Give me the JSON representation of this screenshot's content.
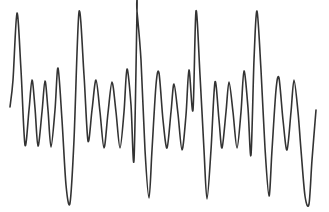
{
  "figure": {
    "name": "waveform-trace",
    "kind": "oscillogram",
    "background_color": "#ffffff",
    "width": 329,
    "height": 212
  },
  "chart_data": {
    "type": "line",
    "title": "",
    "subtitle": "",
    "xlabel": "",
    "ylabel": "",
    "xlim": [
      0,
      329
    ],
    "ylim": [
      212,
      0
    ],
    "grid": false,
    "legend": null,
    "axes_visible": false,
    "tick_labels": {
      "x": [],
      "y": []
    },
    "annotations": [],
    "series": [
      {
        "name": "signal",
        "color": "#333333",
        "line_width": 1.6,
        "smoothing": "cardinal-spline",
        "description": "Five-cycle quasi-periodic oscillation; each cycle contains one tall narrow positive spike, one deep negative spike, and three to four lower-amplitude ripples.",
        "points": [
          [
            10,
            107
          ],
          [
            13,
            80
          ],
          [
            17,
            13
          ],
          [
            21,
            70
          ],
          [
            25,
            145
          ],
          [
            29,
            110
          ],
          [
            32,
            80
          ],
          [
            35,
            108
          ],
          [
            38,
            146
          ],
          [
            42,
            112
          ],
          [
            45,
            81
          ],
          [
            48,
            110
          ],
          [
            51,
            147
          ],
          [
            55,
            110
          ],
          [
            58,
            68
          ],
          [
            62,
            120
          ],
          [
            66,
            185
          ],
          [
            70,
            203
          ],
          [
            74,
            140
          ],
          [
            79,
            12
          ],
          [
            84,
            75
          ],
          [
            88,
            141
          ],
          [
            92,
            110
          ],
          [
            96,
            80
          ],
          [
            100,
            112
          ],
          [
            104,
            148
          ],
          [
            108,
            113
          ],
          [
            112,
            82
          ],
          [
            116,
            112
          ],
          [
            120,
            148
          ],
          [
            124,
            112
          ],
          [
            127,
            69
          ],
          [
            131,
            105
          ],
          [
            134,
            160
          ],
          [
            137,
            11
          ],
          [
            137,
            11
          ],
          [
            141,
            60
          ],
          [
            145,
            150
          ],
          [
            149,
            198
          ],
          [
            152,
            150
          ],
          [
            156,
            85
          ],
          [
            159,
            73
          ],
          [
            163,
            120
          ],
          [
            167,
            148
          ],
          [
            171,
            112
          ],
          [
            174,
            84
          ],
          [
            178,
            114
          ],
          [
            182,
            150
          ],
          [
            186,
            115
          ],
          [
            189,
            70
          ],
          [
            193,
            110
          ],
          [
            196,
            11
          ],
          [
            200,
            75
          ],
          [
            204,
            150
          ],
          [
            207,
            199
          ],
          [
            211,
            150
          ],
          [
            215,
            82
          ],
          [
            219,
            120
          ],
          [
            222,
            148
          ],
          [
            226,
            112
          ],
          [
            229,
            82
          ],
          [
            233,
            112
          ],
          [
            237,
            148
          ],
          [
            241,
            112
          ],
          [
            244,
            71
          ],
          [
            248,
            108
          ],
          [
            251,
            155
          ],
          [
            254,
            60
          ],
          [
            257,
            11
          ],
          [
            261,
            70
          ],
          [
            265,
            148
          ],
          [
            269,
            196
          ],
          [
            272,
            150
          ],
          [
            276,
            90
          ],
          [
            279,
            78
          ],
          [
            283,
            120
          ],
          [
            287,
            150
          ],
          [
            291,
            112
          ],
          [
            294,
            80
          ],
          [
            298,
            112
          ],
          [
            301,
            150
          ],
          [
            305,
            196
          ],
          [
            309,
            204
          ],
          [
            312,
            160
          ],
          [
            316,
            110
          ]
        ]
      }
    ]
  }
}
